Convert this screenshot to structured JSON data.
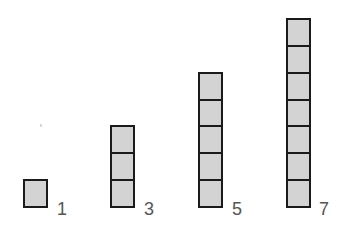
{
  "figure": {
    "cell_fill": "#d3d3d3",
    "cell_border": "#1a1a1a",
    "label_color": "#555555",
    "stacks": [
      {
        "count": 1,
        "label": "1",
        "x": 23,
        "bottom": 208,
        "label_x": 57
      },
      {
        "count": 3,
        "label": "3",
        "x": 110,
        "bottom": 208,
        "label_x": 144
      },
      {
        "count": 5,
        "label": "5",
        "x": 198,
        "bottom": 208,
        "label_x": 232
      },
      {
        "count": 7,
        "label": "7",
        "x": 286,
        "bottom": 208,
        "label_x": 319
      }
    ]
  }
}
